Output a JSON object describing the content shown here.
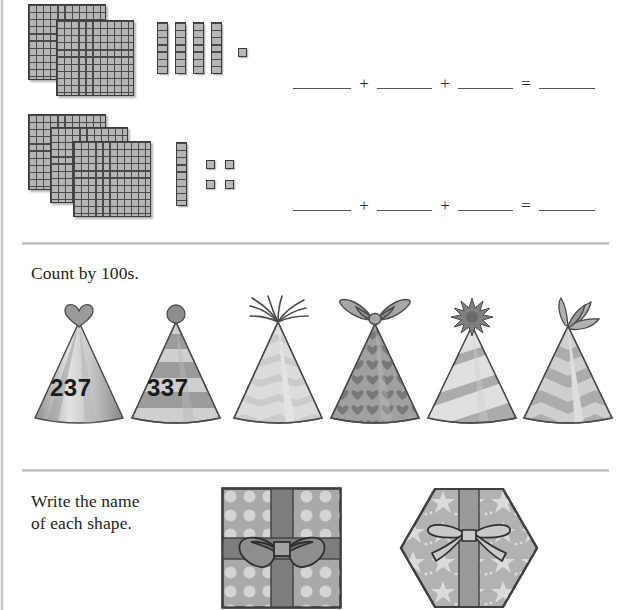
{
  "worksheet": {
    "sections": [
      {
        "id": "base-ten-expanded-form",
        "rows": [
          {
            "id": "row-1",
            "hundreds_count": 2,
            "tens_count": 4,
            "ones_count": 1,
            "represented_value": 241,
            "equation": {
              "blank_1": "",
              "op_1": "+",
              "blank_2": "",
              "op_2": "+",
              "blank_3": "",
              "op_3": "=",
              "blank_4": ""
            }
          },
          {
            "id": "row-2",
            "hundreds_count": 3,
            "tens_count": 1,
            "ones_count": 4,
            "represented_value": 314,
            "equation": {
              "blank_1": "",
              "op_1": "+",
              "blank_2": "",
              "op_2": "+",
              "blank_3": "",
              "op_3": "=",
              "blank_4": ""
            }
          }
        ]
      },
      {
        "id": "count-by-100s",
        "instruction": "Count by 100s.",
        "hats": [
          {
            "label": "237",
            "topper": "heart-topper-icon",
            "pattern": "diagonal-stripes",
            "filled": true
          },
          {
            "label": "337",
            "topper": "pompom-topper-icon",
            "pattern": "horizontal-stripes",
            "filled": true
          },
          {
            "label": "",
            "topper": "tassel-topper-icon",
            "pattern": "chevron",
            "filled": false
          },
          {
            "label": "",
            "topper": "bow-topper-icon",
            "pattern": "hearts",
            "filled": false
          },
          {
            "label": "",
            "topper": "starburst-topper-icon",
            "pattern": "diagonal-stripes",
            "filled": false
          },
          {
            "label": "",
            "topper": "ribbon-topper-icon",
            "pattern": "chevron",
            "filled": false
          }
        ]
      },
      {
        "id": "name-the-shape",
        "instruction_line_1": "Write the name",
        "instruction_line_2": "of each shape.",
        "shapes": [
          {
            "name": "square-gift-box",
            "shape": "square",
            "pattern": "polka-dots",
            "ribbon": "cross-with-bow"
          },
          {
            "name": "hexagon-gift-box",
            "shape": "hexagon",
            "pattern": "stars",
            "ribbon": "vertical-with-bow"
          }
        ]
      }
    ]
  },
  "colors": {
    "page_background": "#ffffff",
    "text": "#231f20",
    "rule_line": "#c4c4c4",
    "block_fill": "#b5b5b5",
    "block_stroke": "#3c3c3c",
    "hat_mid": "#a8a8a8",
    "hat_light": "#d8d8d8",
    "hat_dark": "#8a8a8a",
    "gift_fill": "#b0b0b0",
    "ribbon": "#7d7d7d"
  }
}
